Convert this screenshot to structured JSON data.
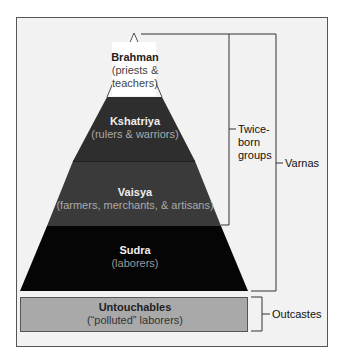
{
  "diagram": {
    "type": "pyramid",
    "layers": [
      {
        "title": "Brahman",
        "subtitle_line1": "(priests &",
        "subtitle_line2": "teachers)",
        "color": "#ffffff"
      },
      {
        "title": "Kshatriya",
        "subtitle": "(rulers & warriors)",
        "color": "#2e2e2e"
      },
      {
        "title": "Vaisya",
        "subtitle": "(farmers, merchants, & artisans)",
        "color": "#3a3a3a"
      },
      {
        "title": "Sudra",
        "subtitle": "(laborers)",
        "color": "#050505"
      }
    ],
    "base_box": {
      "title": "Untouchables",
      "subtitle": "(“polluted” laborers)",
      "color": "#a9a9a9"
    },
    "brackets": {
      "twice_born_line1": "Twice-",
      "twice_born_line2": "born",
      "twice_born_line3": "groups",
      "varnas": "Varnas",
      "outcastes": "Outcastes"
    }
  }
}
